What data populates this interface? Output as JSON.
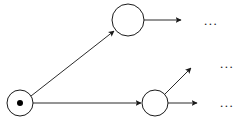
{
  "figure": {
    "type": "directed-graph",
    "background_color": "#ffffff",
    "stroke_color": "#1a1a1a",
    "width": 251,
    "height": 124
  },
  "nodes": [
    {
      "id": "root",
      "label": "",
      "cx": 20,
      "cy": 103,
      "r": 13,
      "has_token": true,
      "token_r": 3
    },
    {
      "id": "upper",
      "label": "",
      "cx": 128,
      "cy": 20,
      "r": 16,
      "has_token": false,
      "token_r": 0
    },
    {
      "id": "lower",
      "label": "",
      "cx": 155,
      "cy": 103,
      "r": 13,
      "has_token": false,
      "token_r": 0
    }
  ],
  "edges": [
    {
      "id": "root-to-upper",
      "from": "root",
      "to": "upper",
      "x1": 31,
      "y1": 96,
      "x2": 114,
      "y2": 31,
      "arrow": true
    },
    {
      "id": "root-to-lower",
      "from": "root",
      "to": "lower",
      "x1": 33,
      "y1": 103,
      "x2": 141,
      "y2": 103,
      "arrow": true
    },
    {
      "id": "upper-out",
      "from": "upper",
      "to": "ellipsis-top",
      "x1": 144,
      "y1": 20,
      "x2": 181,
      "y2": 20,
      "arrow": true
    },
    {
      "id": "lower-out-diagonal",
      "from": "lower",
      "to": "ellipsis-middle",
      "x1": 164,
      "y1": 95,
      "x2": 191,
      "y2": 68,
      "arrow": true
    },
    {
      "id": "lower-out-horizontal",
      "from": "lower",
      "to": "ellipsis-bottom",
      "x1": 168,
      "y1": 103,
      "x2": 197,
      "y2": 103,
      "arrow": true
    }
  ],
  "ellipses": [
    {
      "id": "ellipsis-top",
      "text": "...",
      "x": 204,
      "y": 14
    },
    {
      "id": "ellipsis-middle",
      "text": "...",
      "x": 220,
      "y": 57
    },
    {
      "id": "ellipsis-bottom",
      "text": "...",
      "x": 220,
      "y": 96
    }
  ]
}
